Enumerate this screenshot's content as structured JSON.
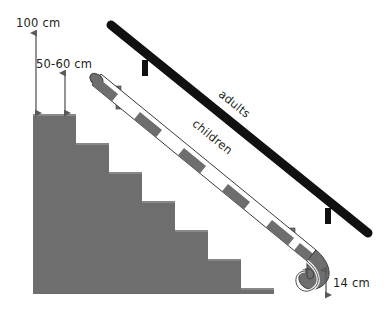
{
  "diagram": {
    "background_color": "#ffffff",
    "width": 385,
    "height": 318
  },
  "colors": {
    "stair_gray": "#6e6e6e",
    "rail_black": "#111111",
    "segment_gray": "#6e6e6e",
    "segment_white": "#ffffff",
    "outline": "#3a3a3a",
    "text": "#231f20",
    "arrow": "#5a5a5a"
  },
  "labels": {
    "height_adults": "100 cm",
    "height_children": "50-60 cm",
    "hook_height": "14 cm",
    "rail_adults": "adults",
    "rail_children": "children"
  },
  "measurements": [
    {
      "name": "adult-handrail-height",
      "value": "100 cm",
      "unit": "cm",
      "amount": 100
    },
    {
      "name": "children-handrail-height",
      "value": "50-60 cm",
      "unit": "cm",
      "range": [
        50,
        60
      ]
    },
    {
      "name": "hook-end-clearance",
      "value": "14 cm",
      "unit": "cm",
      "amount": 14
    }
  ],
  "staircase": {
    "step_count": 7,
    "step_width": 33,
    "step_rise": 29,
    "top_left_x": 33,
    "top_y": 114,
    "base_y": 294
  },
  "rails": [
    {
      "name": "adults-handrail",
      "style": "solid-black",
      "label": "adults"
    },
    {
      "name": "children-handrail",
      "style": "striped-gray-white",
      "label": "children",
      "end": "hook-curve"
    }
  ]
}
